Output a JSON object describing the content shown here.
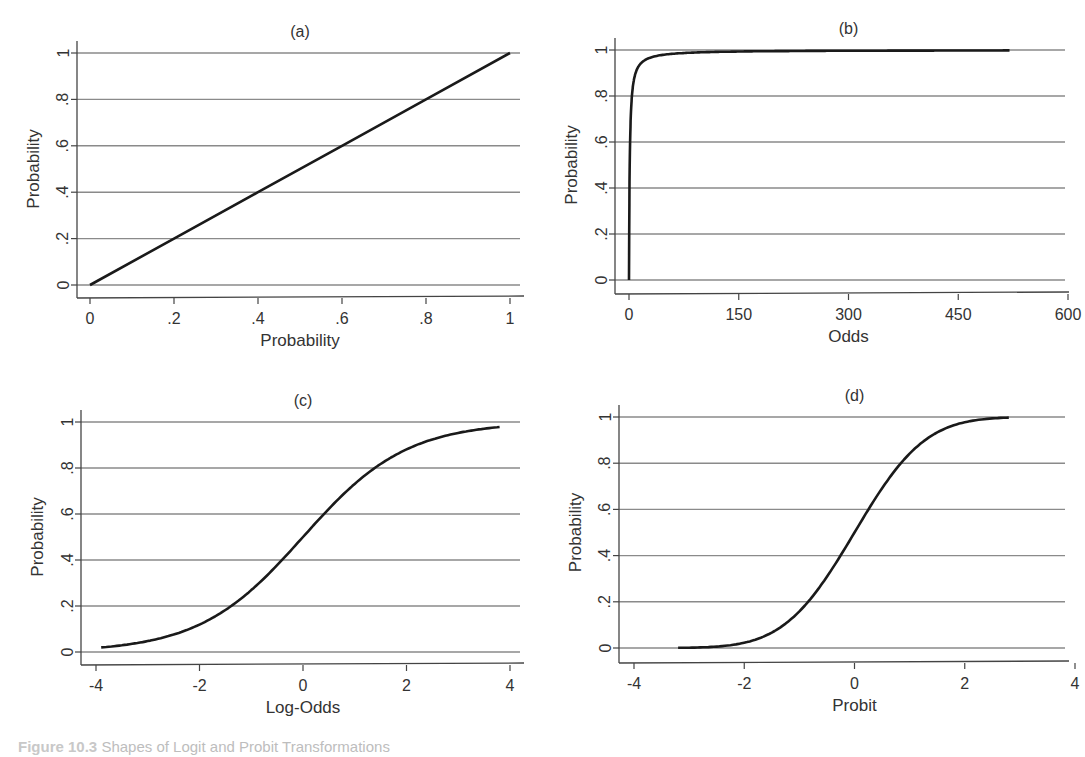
{
  "figure": {
    "caption_label": "Figure 10.3",
    "caption_text": "Shapes of Logit and Probit Transformations"
  },
  "chart_data": [
    {
      "panel": "(a)",
      "type": "line",
      "title": "(a)",
      "xlabel": "Probability",
      "ylabel": "Probability",
      "xlim": [
        0,
        1
      ],
      "ylim": [
        0,
        1
      ],
      "xticks": [
        0,
        0.2,
        0.4,
        0.6,
        0.8,
        1
      ],
      "xtick_labels": [
        "0",
        ".2",
        ".4",
        ".6",
        ".8",
        "1"
      ],
      "yticks": [
        0,
        0.2,
        0.4,
        0.6,
        0.8,
        1
      ],
      "ytick_labels": [
        "0",
        ".2",
        ".4",
        ".6",
        ".8",
        "1"
      ],
      "grid": "horizontal",
      "x": [
        0,
        0.2,
        0.4,
        0.6,
        0.8,
        1.0
      ],
      "y": [
        0,
        0.2,
        0.4,
        0.6,
        0.8,
        1.0
      ]
    },
    {
      "panel": "(b)",
      "type": "line",
      "title": "(b)",
      "xlabel": "Odds",
      "ylabel": "Probability",
      "xlim": [
        0,
        600
      ],
      "ylim": [
        0,
        1
      ],
      "xticks": [
        0,
        150,
        300,
        450,
        600
      ],
      "xtick_labels": [
        "0",
        "150",
        "300",
        "450",
        "600"
      ],
      "yticks": [
        0,
        0.2,
        0.4,
        0.6,
        0.8,
        1
      ],
      "ytick_labels": [
        "0",
        ".2",
        ".4",
        ".6",
        ".8",
        "1"
      ],
      "grid": "horizontal",
      "x": [
        0,
        0.5,
        1,
        2,
        4,
        9,
        19,
        49,
        99,
        199,
        520
      ],
      "y": [
        0,
        0.33,
        0.5,
        0.67,
        0.8,
        0.9,
        0.95,
        0.98,
        0.99,
        0.995,
        0.998
      ]
    },
    {
      "panel": "(c)",
      "type": "line",
      "title": "(c)",
      "xlabel": "Log-Odds",
      "ylabel": "Probability",
      "xlim": [
        -4,
        4
      ],
      "ylim": [
        0,
        1
      ],
      "xticks": [
        -4,
        -2,
        0,
        2,
        4
      ],
      "xtick_labels": [
        "-4",
        "-2",
        "0",
        "2",
        "4"
      ],
      "yticks": [
        0,
        0.2,
        0.4,
        0.6,
        0.8,
        1
      ],
      "ytick_labels": [
        "0",
        ".2",
        ".4",
        ".6",
        ".8",
        "1"
      ],
      "grid": "horizontal",
      "x": [
        -3.9,
        -3,
        -2,
        -1.4,
        -1,
        -0.4,
        0,
        0.4,
        1,
        1.4,
        2,
        3,
        3.8
      ],
      "y": [
        0.02,
        0.047,
        0.12,
        0.2,
        0.27,
        0.4,
        0.5,
        0.6,
        0.73,
        0.8,
        0.88,
        0.95,
        0.978
      ]
    },
    {
      "panel": "(d)",
      "type": "line",
      "title": "(d)",
      "xlabel": "Probit",
      "ylabel": "Probability",
      "xlim": [
        -4,
        4
      ],
      "ylim": [
        0,
        1
      ],
      "xticks": [
        -4,
        -2,
        0,
        2,
        4
      ],
      "xtick_labels": [
        "-4",
        "-2",
        "0",
        "2",
        "4"
      ],
      "yticks": [
        0,
        0.2,
        0.4,
        0.6,
        0.8,
        1
      ],
      "ytick_labels": [
        "0",
        ".2",
        ".4",
        ".6",
        ".8",
        "1"
      ],
      "grid": "horizontal",
      "x": [
        -3.2,
        -2.5,
        -2,
        -1.5,
        -0.84,
        -0.25,
        0,
        0.25,
        0.84,
        1.5,
        2,
        2.5,
        2.8
      ],
      "y": [
        0.001,
        0.006,
        0.023,
        0.067,
        0.2,
        0.4,
        0.5,
        0.6,
        0.8,
        0.933,
        0.977,
        0.994,
        0.997
      ]
    }
  ]
}
